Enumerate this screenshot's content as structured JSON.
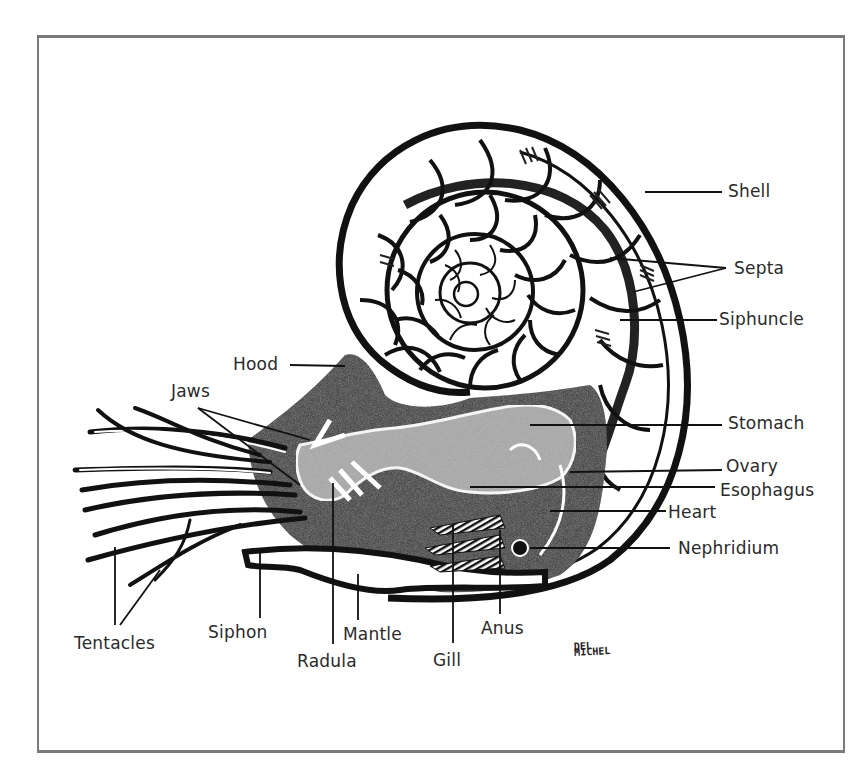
{
  "diagram": {
    "labels": {
      "shell": "Shell",
      "septa": "Septa",
      "siphuncle": "Siphuncle",
      "hood": "Hood",
      "jaws": "Jaws",
      "stomach": "Stomach",
      "ovary": "Ovary",
      "esophagus": "Esophagus",
      "heart": "Heart",
      "nephridium": "Nephridium",
      "tentacles": "Tentacles",
      "siphon": "Siphon",
      "radula": "Radula",
      "mantle": "Mantle",
      "gill": "Gill",
      "anus": "Anus"
    },
    "signature": {
      "line1": "DEL",
      "line2": "MICHEL"
    },
    "colors": {
      "ink": "#111111",
      "body_stipple": "#3a3a3a",
      "organ_gray": "#a8a8a8",
      "frame": "#7a7a7a",
      "background": "#ffffff"
    }
  }
}
